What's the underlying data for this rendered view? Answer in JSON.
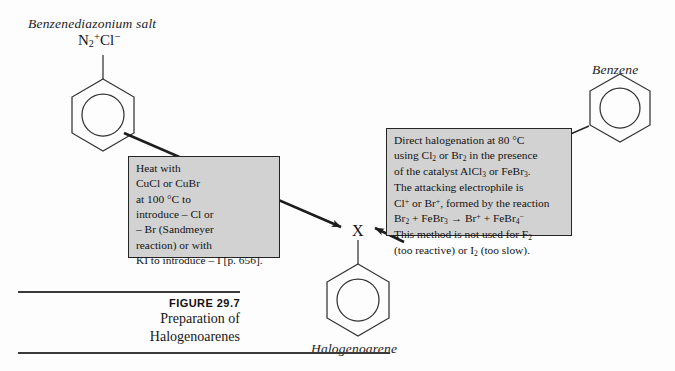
{
  "figure": {
    "number": "FIGURE 29.7",
    "title_line1": "Preparation of",
    "title_line2": "Halogenoarenes"
  },
  "species": {
    "reactant_left_label": "Benzenediazonium salt",
    "reactant_left_formula_html": "N<sub>2</sub><sup>+</sup>Cl<sup>−</sup>",
    "reactant_right_label": "Benzene",
    "product_label": "Halogenoarene",
    "product_substituent": "X"
  },
  "callouts": {
    "left": {
      "lines": [
        "Heat with",
        "CuCl or CuBr",
        "at 100 °C to",
        "introduce  – Cl or",
        "  – Br (Sandmeyer",
        "reaction) or with",
        "KI to introduce  – I [p. 656]."
      ]
    },
    "right": {
      "lines_html": [
        "Direct halogenation at 80 °C",
        "using Cl<sub>2</sub> or Br<sub>2</sub> in the presence",
        "of the catalyst AlCl<sub>3</sub> or FeBr<sub>3</sub>.",
        "The attacking electrophile is",
        "Cl<sup>+</sup> or Br<sup>+</sup>, formed by the reaction",
        "Br<sub>2</sub> + FeBr<sub>3</sub> → Br<sup>+</sup> + FeBr<sub>4</sub><sup>−</sup>",
        "This method is not used for F<sub>2</sub>",
        "(too reactive) or I<sub>2</sub> (too slow)."
      ]
    }
  },
  "colors": {
    "background": "#fdfdfd",
    "ink": "#1a1a1a",
    "callout_fill": "#d2d2d2",
    "callout_border": "#262626",
    "rule": "#3a3a3a"
  },
  "chart_data": {
    "type": "diagram",
    "title": "Preparation of Halogenoarenes",
    "nodes": [
      {
        "id": "benzenediazonium",
        "label": "Benzenediazonium salt",
        "substituent": "N2+Cl-",
        "x": 103,
        "y": 115
      },
      {
        "id": "halogenoarene",
        "label": "Halogenoarene",
        "substituent": "X",
        "x": 358,
        "y": 300
      },
      {
        "id": "benzene",
        "label": "Benzene",
        "substituent": "",
        "x": 620,
        "y": 108
      }
    ],
    "edges": [
      {
        "from": "benzenediazonium",
        "to": "halogenoarene",
        "style": "thick-filled-arrow"
      },
      {
        "from": "benzene",
        "to": "halogenoarene",
        "style": "thick-filled-arrow"
      }
    ],
    "annotations": [
      {
        "attached_to": "benzenediazonium->halogenoarene",
        "box": "left"
      },
      {
        "attached_to": "benzene->halogenoarene",
        "box": "right"
      }
    ]
  }
}
